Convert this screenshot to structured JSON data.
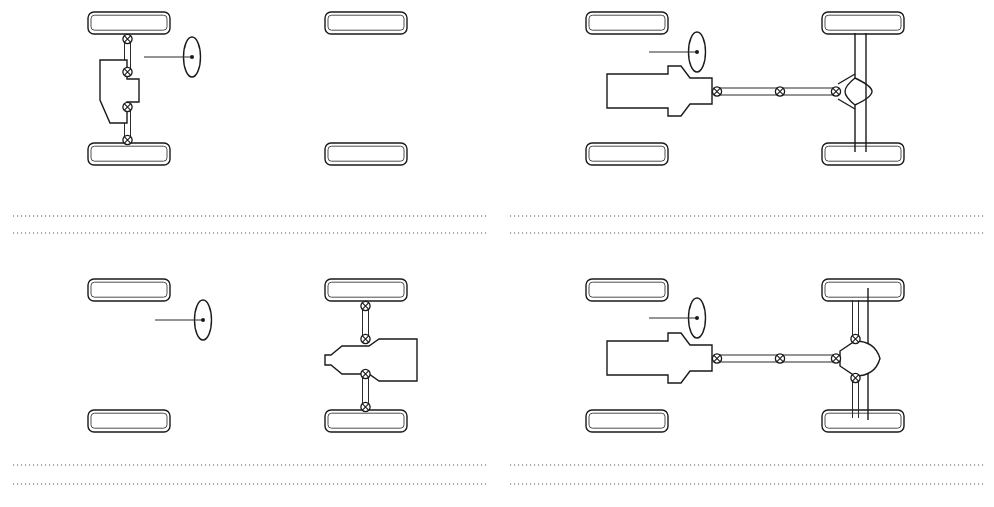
{
  "figure": {
    "width": 994,
    "height": 507,
    "background_color": "#ffffff",
    "ink_color": "#1a1a1a",
    "rule_color": "#8a8a8a"
  },
  "panels": [
    {
      "id": "panel-top-left",
      "position": "top-left",
      "layout_name": "Front-engine front-wheel drive, transverse",
      "drive_axle": "front",
      "engine_position": "front",
      "engine_orientation": "transverse",
      "driven_wheels": [
        "front-left",
        "front-right"
      ],
      "undriven_wheels": [
        "rear-left",
        "rear-right"
      ],
      "has_propshaft": false,
      "joint_count": 4,
      "steering_wheel_side": "right-of-engine"
    },
    {
      "id": "panel-top-right",
      "position": "top-right",
      "layout_name": "Front-engine rear-wheel drive, live axle",
      "drive_axle": "rear",
      "engine_position": "front",
      "engine_orientation": "longitudinal",
      "driven_wheels": [
        "rear-left",
        "rear-right"
      ],
      "undriven_wheels": [
        "front-left",
        "front-right"
      ],
      "has_propshaft": true,
      "joint_count": 3,
      "rear_axle_type": "live beam axle with central differential housing",
      "steering_wheel_side": "left-front"
    },
    {
      "id": "panel-bottom-left",
      "position": "bottom-left",
      "layout_name": "Rear-engine rear-wheel drive, transverse",
      "drive_axle": "rear",
      "engine_position": "rear",
      "engine_orientation": "transverse",
      "driven_wheels": [
        "rear-left",
        "rear-right"
      ],
      "undriven_wheels": [
        "front-left",
        "front-right"
      ],
      "has_propshaft": false,
      "joint_count": 4,
      "steering_wheel_side": "left-front"
    },
    {
      "id": "panel-bottom-right",
      "position": "bottom-right",
      "layout_name": "Front-engine rear-wheel drive, independent rear suspension",
      "drive_axle": "rear",
      "engine_position": "front",
      "engine_orientation": "longitudinal",
      "driven_wheels": [
        "rear-left",
        "rear-right"
      ],
      "undriven_wheels": [
        "front-left",
        "front-right"
      ],
      "has_propshaft": true,
      "joint_count": 5,
      "rear_axle_type": "independent rear suspension with round final-drive housing",
      "steering_wheel_side": "left-front"
    }
  ],
  "separators": [
    {
      "id": "rule-mid-left-upper",
      "orientation": "horizontal",
      "style": "dotted"
    },
    {
      "id": "rule-mid-left-lower",
      "orientation": "horizontal",
      "style": "dotted"
    },
    {
      "id": "rule-mid-right-upper",
      "orientation": "horizontal",
      "style": "dotted"
    },
    {
      "id": "rule-mid-right-lower",
      "orientation": "horizontal",
      "style": "dotted"
    },
    {
      "id": "rule-bottom-left-upper",
      "orientation": "horizontal",
      "style": "dotted"
    },
    {
      "id": "rule-bottom-left-lower",
      "orientation": "horizontal",
      "style": "dotted"
    },
    {
      "id": "rule-bottom-right-upper",
      "orientation": "horizontal",
      "style": "dotted"
    },
    {
      "id": "rule-bottom-right-lower",
      "orientation": "horizontal",
      "style": "dotted"
    }
  ]
}
